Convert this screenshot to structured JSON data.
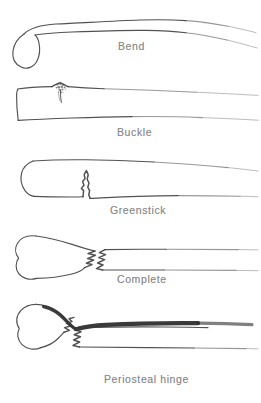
{
  "figure": {
    "background_color": "#ffffff",
    "ink_color": "#3a3a3a",
    "label_color": "#6f6f6f",
    "width": 261,
    "height": 403,
    "style": "hand-drawn scanned line illustration, grayscale, degraded text"
  },
  "panels": [
    {
      "id": "bend",
      "label": "Bend",
      "label_x": 118,
      "label_y": 40,
      "order": 1,
      "description": "Long bone curved into a bow with intact cortices and no visible fracture line; bulbous metaphyseal end at left."
    },
    {
      "id": "buckle",
      "label": "Buckle",
      "label_x": 117,
      "label_y": 126,
      "order": 2,
      "description": "Torus fracture: crumpled speckled wedge of compressed cortex on the upper surface near the metaphysis."
    },
    {
      "id": "greenstick",
      "label": "Greenstick",
      "label_x": 110,
      "label_y": 204,
      "order": 3,
      "description": "Incomplete fracture: jagged crack breaches the lower cortex while the upper cortex remains intact and bent."
    },
    {
      "id": "complete",
      "label": "Complete",
      "label_x": 117,
      "label_y": 273,
      "order": 4,
      "description": "Full transverse break through both cortices with the two jagged fragment ends separated and offset."
    },
    {
      "id": "periosteal-hinge",
      "label": "Periosteal hinge",
      "label_x": 104,
      "label_y": 373,
      "order": 5,
      "description": "Complete fracture with the fragments angulated; a thick dark periosteal sleeve remains attached across the upper surface bridging both fragments."
    }
  ]
}
